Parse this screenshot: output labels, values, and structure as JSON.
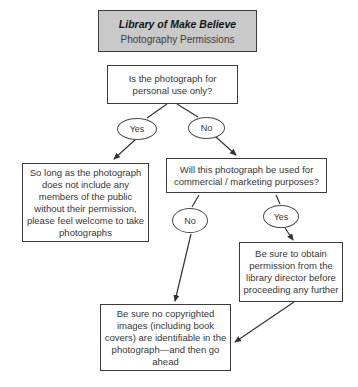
{
  "header": {
    "title": "Library of Make Believe",
    "subtitle": "Photography Permissions"
  },
  "nodes": {
    "question_personal": "Is the photograph for\npersonal use only?",
    "branch_yes_1": "Yes",
    "branch_no_1": "No",
    "outcome_personal": "So long as the photograph\ndoes not include any\nmembers of the public\nwithout their permission,\nplease feel welcome to take\nphotographs",
    "question_commercial": "Will this photograph be used for\ncommercial / marketing purposes?",
    "branch_no_2": "No",
    "branch_yes_2": "Yes",
    "outcome_director": "Be sure to obtain\npermission from the\nlibrary director before\nproceeding any further",
    "outcome_copyright": "Be sure no copyrighted\nimages (including book\ncovers) are identifiable in the\nphotograph—and then go\nahead"
  },
  "colors": {
    "background": "#ffffff",
    "header_fill": "#c9c9c9",
    "box_border": "#3a3a3a",
    "text": "#373737",
    "connector": "#333333"
  }
}
